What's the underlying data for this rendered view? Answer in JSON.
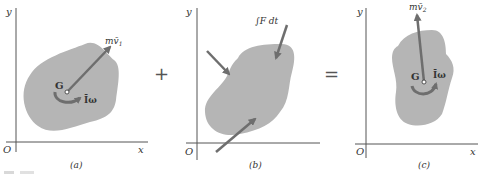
{
  "figure": {
    "panels": [
      {
        "id": "a",
        "label": "(a)",
        "axes": {
          "y": "y",
          "x": "x",
          "origin": "O"
        },
        "center_label": "G",
        "momentum_label": "mv̄",
        "momentum_subscript": "1",
        "angular_label": "Īω"
      },
      {
        "id": "b",
        "label": "(b)",
        "axes": {
          "y": "y",
          "x": "",
          "origin": "O"
        },
        "impulse_label": "∫F dt"
      },
      {
        "id": "c",
        "label": "(c)",
        "axes": {
          "y": "y",
          "x": "x",
          "origin": "O"
        },
        "center_label": "G",
        "momentum_label": "mv̄",
        "momentum_subscript": "2",
        "angular_label": "Īω"
      }
    ],
    "operators": {
      "plus": "+",
      "equals": "="
    },
    "colors": {
      "body_fill": "#b5b5b5",
      "arrow": "#6e6e6e",
      "axis": "#555555",
      "text": "#333333"
    }
  }
}
